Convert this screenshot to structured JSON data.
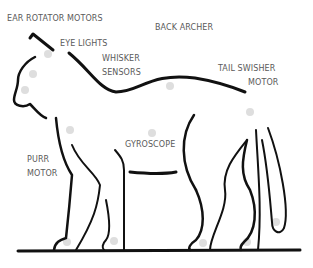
{
  "diagram": {
    "colors": {
      "outline": "#111111",
      "label": "#5a5a5a",
      "marker": "#dedede",
      "background": "#ffffff"
    },
    "labels": {
      "ear_rotator": "EAR ROTATOR MOTORS",
      "back_archer": "BACK ARCHER",
      "eye_lights": "EYE LIGHTS",
      "whisker_1": "WHISKER",
      "whisker_2": "SENSORS",
      "tail_1": "TAIL  SWISHER",
      "tail_2": "MOTOR",
      "gyroscope": "GYROSCOPE",
      "purr_1": "PURR",
      "purr_2": "MOTOR"
    }
  }
}
